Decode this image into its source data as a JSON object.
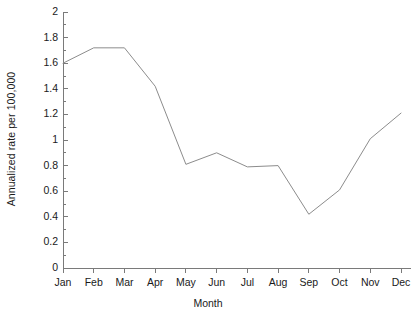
{
  "chart_data": {
    "type": "line",
    "title": "",
    "subtitle": "",
    "xlabel": "Month",
    "ylabel": "Annualized rate per 100,000",
    "categories": [
      "Jan",
      "Feb",
      "Mar",
      "Apr",
      "May",
      "Jun",
      "Jul",
      "Aug",
      "Sep",
      "Oct",
      "Nov",
      "Dec"
    ],
    "values": [
      1.6,
      1.72,
      1.72,
      1.42,
      0.81,
      0.9,
      0.79,
      0.8,
      0.42,
      0.61,
      1.01,
      1.21
    ],
    "series": [
      {
        "name": "Annualized rate",
        "values": [
          1.6,
          1.72,
          1.72,
          1.42,
          0.81,
          0.9,
          0.79,
          0.8,
          0.42,
          0.61,
          1.01,
          1.21
        ],
        "color": "#8c8c8c"
      }
    ],
    "ylim": [
      0,
      2
    ],
    "ytick_labels": [
      "0",
      "0.2",
      "0.4",
      "0.6",
      "0.8",
      "1",
      "1.2",
      "1.4",
      "1.6",
      "1.8",
      "2"
    ],
    "ytick_values": [
      0,
      0.2,
      0.4,
      0.6,
      0.8,
      1.0,
      1.2,
      1.4,
      1.6,
      1.8,
      2.0
    ],
    "yminor_step": 0.1,
    "xtick_labels": [
      "Jan",
      "Feb",
      "Mar",
      "Apr",
      "May",
      "Jun",
      "Jul",
      "Aug",
      "Sep",
      "Oct",
      "Nov",
      "Dec"
    ],
    "grid": false,
    "legend": false,
    "legend_position": "none",
    "markers": false,
    "annotations": [],
    "axis_color": "#7a7a7a",
    "background": "#ffffff"
  }
}
